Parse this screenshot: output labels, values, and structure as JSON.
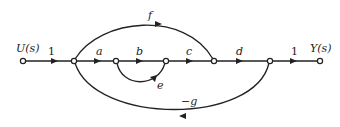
{
  "diagram": {
    "type": "signal-flow-graph",
    "input_label": "U(s)",
    "output_label": "Y(s)",
    "branches": {
      "input_gain": "1",
      "a": "a",
      "b": "b",
      "c": "c",
      "d": "d",
      "output_gain": "1",
      "feedforward": "f",
      "self_loop": "e",
      "feedback": "−g"
    },
    "colors": {
      "stroke": "#222222",
      "background": "#ffffff"
    }
  }
}
